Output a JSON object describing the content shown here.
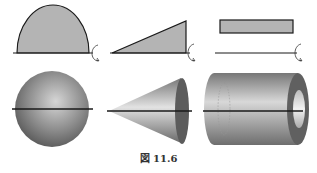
{
  "figure": {
    "caption": "図 11.6",
    "colors": {
      "fill_gray": "#b4b4b4",
      "stroke": "#1a1a1a",
      "solid_dark": "#5a5a5a",
      "solid_light": "#d8d8d8"
    },
    "panels": [
      {
        "row": 1,
        "col": 1,
        "shape": "semicircle",
        "description": "Half-disk region on axis with rotation arrow"
      },
      {
        "row": 1,
        "col": 2,
        "shape": "right-triangle",
        "description": "Right triangle region on axis with rotation arrow"
      },
      {
        "row": 1,
        "col": 3,
        "shape": "rectangle-offset",
        "description": "Rectangle above axis with rotation arrow"
      },
      {
        "row": 2,
        "col": 1,
        "shape": "sphere",
        "description": "Solid of revolution: sphere"
      },
      {
        "row": 2,
        "col": 2,
        "shape": "cone",
        "description": "Solid of revolution: cone"
      },
      {
        "row": 2,
        "col": 3,
        "shape": "hollow-cylinder",
        "description": "Solid of revolution: hollow cylinder (tube)"
      }
    ]
  }
}
